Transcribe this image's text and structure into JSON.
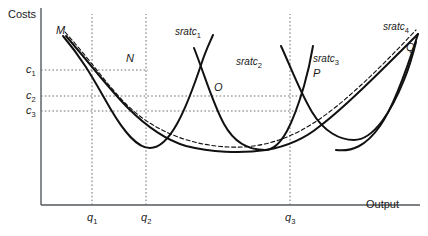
{
  "chart_data": {
    "type": "line",
    "title": "",
    "xlabel": "Output",
    "ylabel": "Costs",
    "grid": false,
    "legend_position": "inline-labels",
    "axes": {
      "x_origin_px": 41,
      "y_baseline_px": 205,
      "y_top_px": 8,
      "x_end_px": 420
    },
    "y_ticks": [
      {
        "label": "c",
        "sub": "1",
        "y_px": 70
      },
      {
        "label": "c",
        "sub": "2",
        "y_px": 96
      },
      {
        "label": "c",
        "sub": "3",
        "y_px": 111
      }
    ],
    "x_ticks": [
      {
        "label": "q",
        "sub": "1",
        "x_px": 92
      },
      {
        "label": "q",
        "sub": "2",
        "x_px": 146
      },
      {
        "label": "q",
        "sub": "3",
        "x_px": 290
      }
    ],
    "series": [
      {
        "name": "sratc",
        "sub": "1",
        "style": "solid",
        "label_x_px": 175,
        "label_y_px": 27,
        "path": "M 63,36 C 85,62 96,84 110,108 C 124,132 137,148 150,148 C 170,148 186,110 202,62 C 206,50 210,42 213,35"
      },
      {
        "name": "sratc",
        "sub": "2",
        "style": "solid",
        "label_x_px": 236,
        "label_y_px": 57,
        "path": "M 194,48 C 205,76 213,104 224,124 C 236,146 252,150 265,150 C 282,150 294,120 304,86 C 308,72 311,58 313,46"
      },
      {
        "name": "sratc",
        "sub": "3",
        "style": "solid",
        "label_x_px": 313,
        "label_y_px": 54,
        "path": "M 281,46 C 292,70 300,92 312,112 C 324,132 340,140 354,140 C 374,140 392,110 404,80 C 409,68 413,54 416,42"
      },
      {
        "name": "sratc",
        "sub": "4",
        "style": "solid",
        "label_x_px": 383,
        "label_y_px": 22,
        "path": "M 336,150 C 352,152 366,146 380,126 C 394,106 406,72 418,34"
      },
      {
        "name": "lratc-envelope",
        "sub": "",
        "style": "dashed",
        "label_x_px": 0,
        "label_y_px": 0,
        "path": "M 65,32 C 92,62 108,86 126,104 C 150,128 182,142 216,146 C 250,150 280,144 312,124 C 344,104 380,68 416,30"
      },
      {
        "name": "lratc-solid-scallops",
        "sub": "",
        "style": "solid",
        "label_x_px": 0,
        "label_y_px": 0,
        "path": "M 66,36 C 92,66 110,90 128,108 C 146,126 166,140 186,146 M 186,146 C 210,152 240,154 266,150 C 290,146 308,136 320,126 M 320,126 C 344,108 382,70 418,34"
      }
    ],
    "points": [
      {
        "label": "M",
        "x_px": 56,
        "y_px": 25
      },
      {
        "label": "N",
        "x_px": 126,
        "y_px": 53
      },
      {
        "label": "O",
        "x_px": 214,
        "y_px": 82
      },
      {
        "label": "P",
        "x_px": 313,
        "y_px": 68
      },
      {
        "label": "Q",
        "x_px": 406,
        "y_px": 42
      }
    ]
  },
  "labels": {
    "y_axis_title": "Costs",
    "x_axis_title": "Output"
  }
}
